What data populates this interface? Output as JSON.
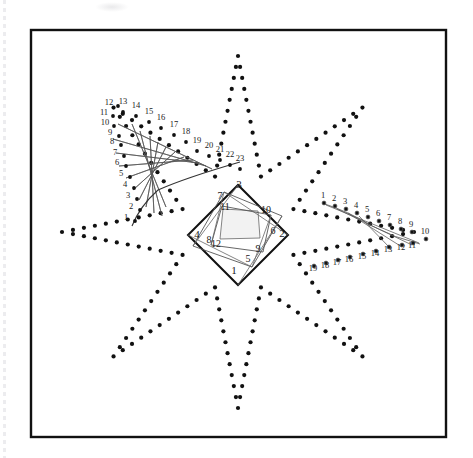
{
  "figure": {
    "title_semantic": "envelope-and-nested-squares-geometric-plate",
    "frame": {
      "stroke_color": "#111111",
      "fill_color": "#ffffff",
      "x": 31,
      "y": 30,
      "width": 415,
      "height": 407,
      "stroke_width": 2.4
    },
    "ink_color": "#111111",
    "line_color": "#555555",
    "dot_color": "#111111",
    "dot_radius": 2.1
  },
  "star": {
    "name": "eight-pointed-dotted-star",
    "center_x": 238,
    "center_y": 232,
    "point_count": 8,
    "outer_radius": 176,
    "inner_radius": 60,
    "dots_per_edge": 11,
    "rotation_deg": -90
  },
  "envelope_left": {
    "name": "parabolic-envelope-upper-left",
    "label_count": 23,
    "labels": [
      "1",
      "2",
      "3",
      "4",
      "5",
      "6",
      "7",
      "8",
      "9",
      "10",
      "11",
      "12",
      "13",
      "14",
      "15",
      "16",
      "17",
      "18",
      "19",
      "20",
      "21",
      "22",
      "23"
    ],
    "arm_a_points": [
      [
        118,
        124
      ],
      [
        113,
        139
      ],
      [
        116,
        153
      ],
      [
        119,
        166
      ],
      [
        126,
        178
      ],
      [
        133,
        190
      ],
      [
        139,
        200
      ],
      [
        146,
        207
      ],
      [
        154,
        213
      ],
      [
        162,
        216
      ],
      [
        166,
        207
      ],
      [
        163,
        196
      ]
    ],
    "arm_b_points": [
      [
        132,
        124
      ],
      [
        140,
        131
      ],
      [
        150,
        136
      ],
      [
        158,
        142
      ],
      [
        166,
        147
      ],
      [
        175,
        152
      ],
      [
        184,
        157
      ],
      [
        193,
        160
      ],
      [
        199,
        163
      ],
      [
        206,
        166
      ],
      [
        212,
        169
      ]
    ],
    "chord_pairs": [
      [
        0,
        10
      ],
      [
        1,
        9
      ],
      [
        2,
        8
      ],
      [
        3,
        7
      ],
      [
        4,
        6
      ],
      [
        5,
        5
      ],
      [
        6,
        4
      ],
      [
        7,
        3
      ],
      [
        8,
        2
      ],
      [
        9,
        1
      ],
      [
        10,
        0
      ]
    ],
    "label_positions": [
      {
        "t": "1",
        "x": 126,
        "y": 220
      },
      {
        "t": "2",
        "x": 131,
        "y": 209
      },
      {
        "t": "3",
        "x": 128,
        "y": 198
      },
      {
        "t": "4",
        "x": 125,
        "y": 187
      },
      {
        "t": "5",
        "x": 121,
        "y": 176
      },
      {
        "t": "6",
        "x": 117,
        "y": 165
      },
      {
        "t": "7",
        "x": 115,
        "y": 155
      },
      {
        "t": "8",
        "x": 112,
        "y": 144
      },
      {
        "t": "9",
        "x": 110,
        "y": 135
      },
      {
        "t": "10",
        "x": 105,
        "y": 125
      },
      {
        "t": "11",
        "x": 104,
        "y": 115
      },
      {
        "t": "12",
        "x": 109,
        "y": 105
      },
      {
        "t": "13",
        "x": 123,
        "y": 104
      },
      {
        "t": "14",
        "x": 136,
        "y": 108
      },
      {
        "t": "15",
        "x": 149,
        "y": 114
      },
      {
        "t": "16",
        "x": 161,
        "y": 120
      },
      {
        "t": "17",
        "x": 174,
        "y": 127
      },
      {
        "t": "18",
        "x": 186,
        "y": 134
      },
      {
        "t": "19",
        "x": 197,
        "y": 143
      },
      {
        "t": "20",
        "x": 209,
        "y": 148
      },
      {
        "t": "21",
        "x": 220,
        "y": 152
      },
      {
        "t": "22",
        "x": 230,
        "y": 157
      },
      {
        "t": "23",
        "x": 240,
        "y": 161
      }
    ]
  },
  "envelope_right": {
    "name": "fan-envelope-right",
    "label_count": 19,
    "labels_upper": [
      "1",
      "2",
      "3",
      "4",
      "5",
      "6",
      "7",
      "8",
      "9",
      "10"
    ],
    "labels_lower": [
      "11",
      "12",
      "13",
      "14",
      "15",
      "16",
      "17",
      "18",
      "19"
    ],
    "label_positions": [
      {
        "t": "1",
        "x": 323,
        "y": 198
      },
      {
        "t": "2",
        "x": 334,
        "y": 201
      },
      {
        "t": "3",
        "x": 345,
        "y": 204
      },
      {
        "t": "4",
        "x": 356,
        "y": 208
      },
      {
        "t": "5",
        "x": 367,
        "y": 212
      },
      {
        "t": "6",
        "x": 378,
        "y": 216
      },
      {
        "t": "7",
        "x": 389,
        "y": 220
      },
      {
        "t": "8",
        "x": 400,
        "y": 224
      },
      {
        "t": "9",
        "x": 411,
        "y": 227
      },
      {
        "t": "10",
        "x": 425,
        "y": 234
      },
      {
        "t": "11",
        "x": 412,
        "y": 248
      },
      {
        "t": "12",
        "x": 401,
        "y": 250
      },
      {
        "t": "13",
        "x": 388,
        "y": 252
      },
      {
        "t": "14",
        "x": 375,
        "y": 256
      },
      {
        "t": "15",
        "x": 362,
        "y": 259
      },
      {
        "t": "16",
        "x": 349,
        "y": 262
      },
      {
        "t": "17",
        "x": 337,
        "y": 265
      },
      {
        "t": "18",
        "x": 325,
        "y": 268
      },
      {
        "t": "19",
        "x": 313,
        "y": 271
      }
    ],
    "fan_lines": [
      [
        [
          326,
          205
        ],
        [
          419,
          243
        ]
      ],
      [
        [
          337,
          209
        ],
        [
          412,
          245
        ]
      ],
      [
        [
          348,
          213
        ],
        [
          402,
          247
        ]
      ],
      [
        [
          359,
          216
        ],
        [
          391,
          249
        ]
      ]
    ]
  },
  "squares": {
    "name": "nested-rotating-squares-spiral",
    "outer": {
      "labels": [
        "1",
        "2",
        "3",
        "4"
      ],
      "points": [
        [
          238,
          285
        ],
        [
          288,
          235
        ],
        [
          238,
          185
        ],
        [
          188,
          235
        ]
      ],
      "label_positions": [
        {
          "t": "1",
          "x": 234,
          "y": 274
        },
        {
          "t": "2",
          "x": 282,
          "y": 237
        },
        {
          "t": "3",
          "x": 239,
          "y": 188
        },
        {
          "t": "4",
          "x": 197,
          "y": 238
        }
      ]
    },
    "middle": {
      "labels": [
        "5",
        "6",
        "7",
        "8"
      ],
      "points": [
        [
          252,
          267
        ],
        [
          282,
          216
        ],
        [
          224,
          192
        ],
        [
          193,
          246
        ]
      ],
      "label_positions": [
        {
          "t": "5",
          "x": 248,
          "y": 262
        },
        {
          "t": "6",
          "x": 273,
          "y": 234
        },
        {
          "t": "7",
          "x": 220,
          "y": 199
        },
        {
          "t": "8",
          "x": 209,
          "y": 243
        }
      ]
    },
    "inner": {
      "labels": [
        "9",
        "10",
        "11",
        "12"
      ],
      "points": [
        [
          263,
          252
        ],
        [
          271,
          215
        ],
        [
          222,
          206
        ],
        [
          211,
          245
        ]
      ],
      "label_positions": [
        {
          "t": "9",
          "x": 258,
          "y": 252
        },
        {
          "t": "10",
          "x": 266,
          "y": 213
        },
        {
          "t": "11",
          "x": 225,
          "y": 210
        },
        {
          "t": "12",
          "x": 216,
          "y": 247
        }
      ]
    },
    "innermost": {
      "points": [
        [
          260,
          238
        ],
        [
          258,
          211
        ],
        [
          223,
          209
        ],
        [
          220,
          239
        ]
      ],
      "fill": "#f2f2f2"
    }
  }
}
